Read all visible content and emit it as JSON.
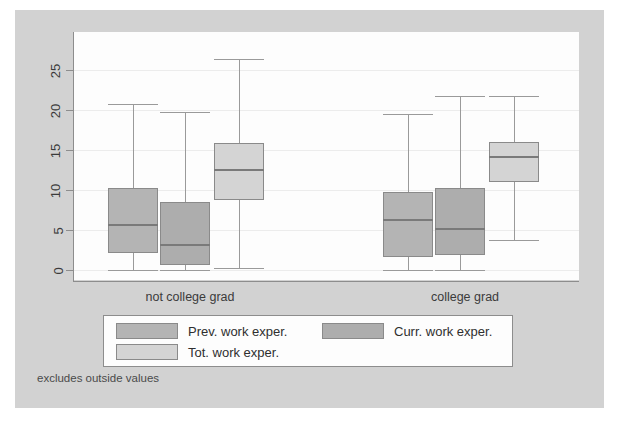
{
  "figure": {
    "footnote": "excludes outside values",
    "background_color": "#d2d2d2",
    "plot_background_color": "#fdfdfd"
  },
  "legend": {
    "entries": [
      {
        "label": "Prev. work exper.",
        "color": "#b4b4b4"
      },
      {
        "label": "Curr. work exper.",
        "color": "#adadad"
      },
      {
        "label": "Tot. work exper.",
        "color": "#d4d4d4"
      }
    ]
  },
  "chart_data": {
    "type": "box",
    "title": "",
    "xlabel": "",
    "ylabel": "",
    "ylim": [
      0,
      27
    ],
    "yticks": [
      0,
      5,
      10,
      15,
      20,
      25
    ],
    "ytick_labels": [
      "0",
      "5",
      "10",
      "15",
      "20",
      "25"
    ],
    "grid": true,
    "legend_position": "bottom",
    "categories": [
      "not college grad",
      "college grad"
    ],
    "series": [
      {
        "name": "Prev. work exper.",
        "color": "#b4b4b4",
        "boxes": [
          {
            "category": "not college grad",
            "whisker_low": 0.0,
            "q1": 2.1,
            "median": 5.7,
            "q3": 10.2,
            "whisker_high": 20.8
          },
          {
            "category": "college grad",
            "whisker_low": 0.0,
            "q1": 1.6,
            "median": 6.4,
            "q3": 9.8,
            "whisker_high": 19.5
          }
        ]
      },
      {
        "name": "Curr. work exper.",
        "color": "#adadad",
        "boxes": [
          {
            "category": "not college grad",
            "whisker_low": 0.0,
            "q1": 0.6,
            "median": 3.3,
            "q3": 8.5,
            "whisker_high": 19.8
          },
          {
            "category": "college grad",
            "whisker_low": 0.0,
            "q1": 1.9,
            "median": 5.2,
            "q3": 10.3,
            "whisker_high": 21.7
          }
        ]
      },
      {
        "name": "Tot. work exper.",
        "color": "#d4d4d4",
        "boxes": [
          {
            "category": "not college grad",
            "whisker_low": 0.3,
            "q1": 8.8,
            "median": 12.6,
            "q3": 15.9,
            "whisker_high": 26.4
          },
          {
            "category": "college grad",
            "whisker_low": 3.8,
            "q1": 11.0,
            "median": 14.2,
            "q3": 16.0,
            "whisker_high": 21.7
          }
        ]
      }
    ]
  }
}
